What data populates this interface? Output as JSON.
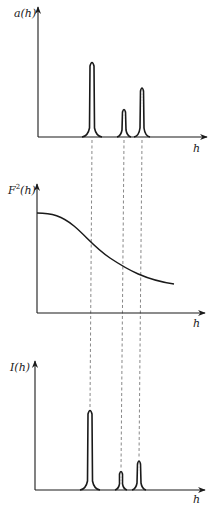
{
  "panels": [
    {
      "id": "atomic-scattering",
      "y_label": "a(h)",
      "x_label": "h",
      "peaks": [
        {
          "h_pos": 92,
          "height": 75
        },
        {
          "h_pos": 124,
          "height": 28
        },
        {
          "h_pos": 142,
          "height": 49
        }
      ]
    },
    {
      "id": "structure-factor-squared",
      "y_label_base": "F",
      "y_label_sup": "2",
      "y_label_tail": "(h)",
      "x_label": "h",
      "curve": "smooth monotonically decreasing sigmoid-like falloff"
    },
    {
      "id": "intensity",
      "y_label": "I(h)",
      "x_label": "h",
      "peaks": [
        {
          "h_pos": 90,
          "height": 80
        },
        {
          "h_pos": 121,
          "height": 18
        },
        {
          "h_pos": 139,
          "height": 29
        }
      ]
    }
  ],
  "connectors": {
    "style": "dashed vertical lines linking peak positions across panels",
    "count": 3
  },
  "colors": {
    "ink": "#1a1a1a",
    "background": "#ffffff",
    "dash": "#555555"
  }
}
